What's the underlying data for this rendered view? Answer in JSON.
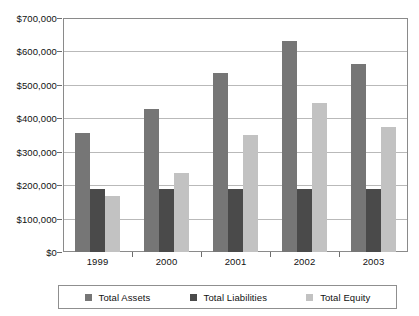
{
  "chart_data": {
    "type": "bar",
    "title": "",
    "subtitle": "",
    "xlabel": "",
    "ylabel": "",
    "categories": [
      "1999",
      "2000",
      "2001",
      "2002",
      "2003"
    ],
    "series": [
      {
        "name": "Total Assets",
        "color": "#767676",
        "values": [
          355000,
          428000,
          535000,
          632000,
          562000
        ]
      },
      {
        "name": "Total Liabilities",
        "color": "#4a4a4a",
        "values": [
          190000,
          190000,
          190000,
          190000,
          190000
        ]
      },
      {
        "name": "Total Equity",
        "color": "#c2c2c2",
        "values": [
          167000,
          237000,
          349000,
          446000,
          374000
        ]
      }
    ],
    "ylim": [
      0,
      700000
    ],
    "yticks": [
      0,
      100000,
      200000,
      300000,
      400000,
      500000,
      600000,
      700000
    ],
    "ytick_labels": [
      "$0",
      "$100,000",
      "$200,000",
      "$300,000",
      "$400,000",
      "$500,000",
      "$600,000",
      "$700,000"
    ],
    "grid": true,
    "legend_position": "bottom",
    "legend_entries": [
      "Total Assets",
      "Total Liabilities",
      "Total Equity"
    ]
  }
}
